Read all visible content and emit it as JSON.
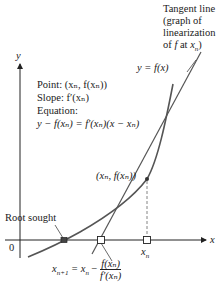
{
  "labels": {
    "tangent_title": [
      "Tangent line",
      "(graph of",
      "linearization"
    ],
    "tangent_last": {
      "prefix": "of ",
      "f": "f",
      "at": " at ",
      "x": "x",
      "sub": "n",
      "close": ")"
    },
    "curve_label": "y = f(x)",
    "y_axis": "y",
    "x_axis": "x",
    "origin": "0",
    "point_line": "Point: (xₙ, f(xₙ))",
    "slope_line": "Slope: f′(xₙ)",
    "equation_heading": "Equation:",
    "equation": "y − f(xₙ) = f′(xₙ)(x − xₙ)",
    "point_label": "(xₙ, f(xₙ))",
    "root_label": "Root sought",
    "xn_label": "x",
    "xn_sub": "n",
    "newton_lhs": "x",
    "newton_lhs_sub": "n+1",
    "newton_eq": " = x",
    "newton_eq_sub": "n",
    "newton_minus": " − ",
    "newton_num": "f(xₙ)",
    "newton_den": "f′(xₙ)"
  },
  "colors": {
    "curve": "#555555",
    "tangent": "#555555",
    "axis": "#222222",
    "marker_fill": "#ffffff",
    "root_fill": "#444444"
  },
  "markers": [
    {
      "name": "root-sought-marker",
      "x": 64,
      "y": 240
    },
    {
      "name": "x-n-plus-1-marker",
      "x": 101,
      "y": 240
    },
    {
      "name": "x-n-marker",
      "x": 147,
      "y": 240
    }
  ]
}
